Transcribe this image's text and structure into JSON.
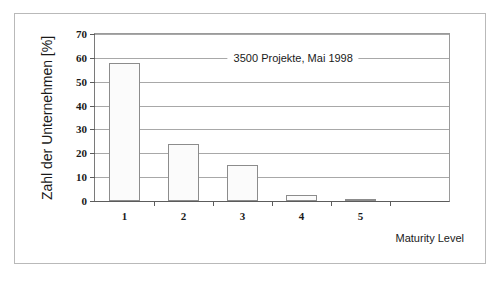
{
  "figure": {
    "frame_border_color": "#b9b9b9",
    "background": "#ffffff"
  },
  "chart_data": {
    "type": "bar",
    "title": "",
    "subtitle": "",
    "xlabel": "Maturity Level",
    "ylabel": "Zahl der Unternehmen [%]",
    "categories": [
      "1",
      "2",
      "3",
      "4",
      "5",
      ""
    ],
    "values": [
      58,
      24,
      15,
      2.5,
      1,
      null
    ],
    "ylim": [
      0,
      70
    ],
    "ytick_labels": [
      "0",
      "10",
      "20",
      "30",
      "40",
      "50",
      "60",
      "70"
    ],
    "ytick_values": [
      0,
      10,
      20,
      30,
      40,
      50,
      60,
      70
    ],
    "grid": "horizontal",
    "legend": "none",
    "annotations": [
      {
        "text": "3500 Projekte, Mai 1998",
        "x_category_fraction": 0.56,
        "y_value": 60
      }
    ],
    "bar_fill_color": "#fbfbfb",
    "bar_edge_color": "#8c8c8c",
    "grid_color": "#a8a8a8",
    "axis_color": "#5c5c5c"
  }
}
